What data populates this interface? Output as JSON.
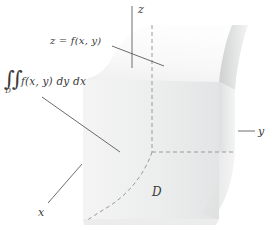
{
  "figure": {
    "type": "3d-solid-region-diagram",
    "width": 272,
    "height": 230,
    "background": "#ffffff"
  },
  "axes": {
    "z": {
      "label": "z",
      "orientation": "vertical"
    },
    "y": {
      "label": "y",
      "orientation": "horizontal-right"
    },
    "x": {
      "label": "x",
      "orientation": "diagonal-lower-left"
    }
  },
  "labels": {
    "surface": "z = f(x, y)",
    "region": "D"
  },
  "integral": {
    "signs": "∫∫",
    "subscript": "D",
    "body": "f(x, y) dy dx",
    "full_text": "∫∫_D f(x, y) dy dx"
  },
  "colors": {
    "stroke": "#6e6e6e",
    "text": "#3a3a3a",
    "dashed": "#9a9a9a",
    "front_face_light": "#f2f2f2",
    "front_face_dark": "#e4e4e4",
    "top_surface": "#f7f7f7",
    "side_surface": "#d9d9d9",
    "side_surface_dark": "#c9c9c9"
  },
  "elements": {
    "front_face": "vertical rectangular face of the solid",
    "top_surface": "curved surface z = f(x,y) forming the roof",
    "right_surface": "curved lateral surface sweeping to the right",
    "base_region": "region D in the xy-plane bounded by a dashed curve",
    "dashed_curve": "boundary curve of region D",
    "dashed_vertical": "vertical dashed line on the solid",
    "dashed_horizontal": "horizontal dashed line across the base"
  },
  "leader_lines": [
    {
      "from": "surface-label",
      "to": "top-surface"
    },
    {
      "from": "integral-label",
      "to": "front-face"
    },
    {
      "from": "x-axis-label",
      "to": "front-lower-left-edge"
    },
    {
      "from": "y-axis-label",
      "to": "right-surface"
    }
  ]
}
